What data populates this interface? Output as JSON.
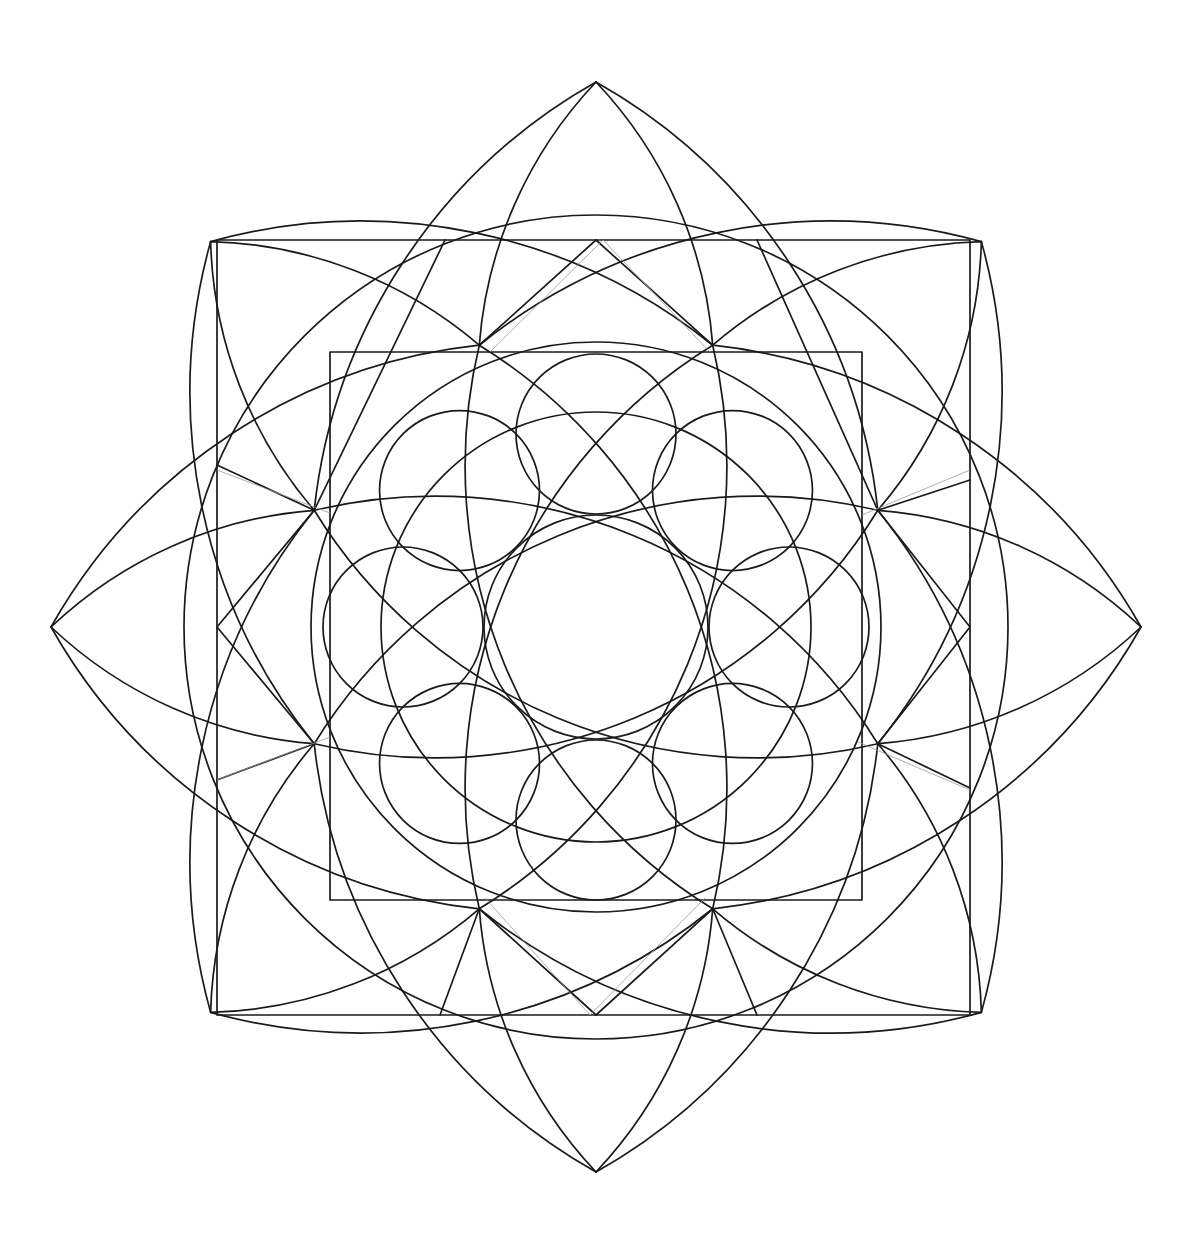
{
  "figure": {
    "ink_color": "#1a1a1a",
    "background": "#ffffff",
    "center": [
      596,
      627
    ],
    "outer_circle_radius": 412,
    "mid_circle_radius": 285,
    "second_circle_radius": 215,
    "inner_circle_radius": 112,
    "small_circles": {
      "count": 8,
      "radius": 80,
      "ring_radius": 193
    },
    "outer_square": {
      "x1": 217,
      "y1": 240,
      "x2": 970,
      "y2": 1015
    },
    "inner_square": {
      "x1": 330,
      "y1": 352,
      "x2": 862,
      "y2": 900
    },
    "star_petals": 8,
    "star_tip_radius": 545
  }
}
